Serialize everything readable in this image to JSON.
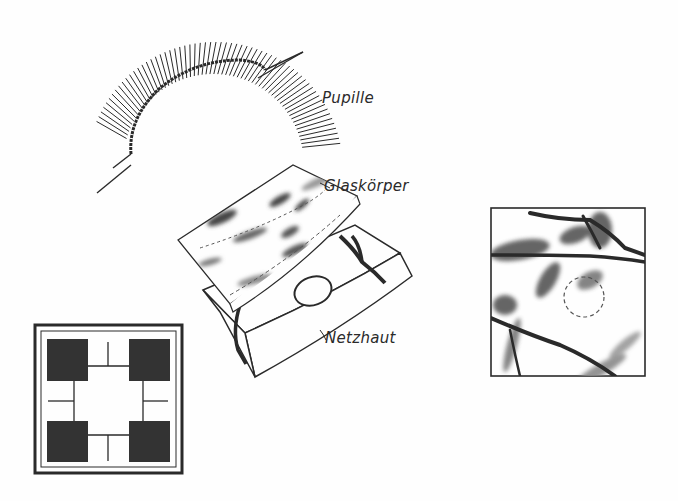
{
  "diagram": {
    "labels": {
      "pupil": "Pupille",
      "vitreous": "Glaskörper",
      "retina": "Netzhaut"
    },
    "colors": {
      "ink": "#2a2a2a",
      "shade": "#8a8a8a",
      "paper": "#fefefe"
    },
    "panels": [
      {
        "id": "pupil-arc",
        "description": "Iris ring segment with radial fibres around pupil edge"
      },
      {
        "id": "vitreous-retina-stack",
        "description": "Exploded view: Glaskörper sheet above Netzhaut block with blood vessels and optic disc"
      },
      {
        "id": "retina-closeup",
        "description": "Square close-up of retinal vessels with dashed blind spot circle"
      },
      {
        "id": "pixel-grid",
        "description": "Square frame with four dark blocks connected by thin lines"
      }
    ]
  }
}
